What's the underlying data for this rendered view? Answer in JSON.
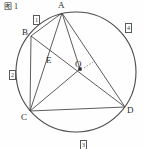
{
  "figure": {
    "caption": "图 1",
    "vertices": [
      {
        "name": "A",
        "label": "A",
        "x": 62,
        "y": 13,
        "lx": 58,
        "ly": 1
      },
      {
        "name": "B",
        "label": "B",
        "x": 31,
        "y": 36,
        "lx": 22,
        "ly": 28
      },
      {
        "name": "C",
        "label": "C",
        "x": 30,
        "y": 111,
        "lx": 21,
        "ly": 113
      },
      {
        "name": "D",
        "label": "D",
        "x": 125,
        "y": 107,
        "lx": 127,
        "ly": 106
      },
      {
        "name": "E",
        "label": "E",
        "x": 53,
        "y": 62,
        "lx": 46,
        "ly": 56
      },
      {
        "name": "O",
        "label": "O",
        "x": 80,
        "y": 69,
        "lx": 75,
        "ly": 60
      }
    ],
    "arc_labels": [
      {
        "name": "arc-label-1",
        "label": "1",
        "x": 33,
        "y": 9
      },
      {
        "name": "arc-label-2",
        "label": "2",
        "x": 9,
        "y": 64
      },
      {
        "name": "arc-label-3",
        "label": "3",
        "x": 80,
        "y": 134
      },
      {
        "name": "arc-label-4",
        "label": "4",
        "x": 125,
        "y": 17
      }
    ],
    "circle": {
      "cx": 76,
      "cy": 72,
      "r": 60
    },
    "segments": [
      {
        "name": "segment-AB",
        "from": "A",
        "to": "B"
      },
      {
        "name": "segment-AC",
        "from": "A",
        "to": "C"
      },
      {
        "name": "segment-AD",
        "from": "A",
        "to": "D"
      },
      {
        "name": "segment-AO",
        "from": "A",
        "to": "O"
      },
      {
        "name": "segment-BC",
        "from": "B",
        "to": "C"
      },
      {
        "name": "segment-BD",
        "from": "B",
        "to": "D"
      },
      {
        "name": "segment-CD",
        "from": "C",
        "to": "D"
      },
      {
        "name": "segment-CO",
        "from": "C",
        "to": "O"
      }
    ],
    "colors": {
      "stroke": "#4a4a4a",
      "text": "#2b2b2b",
      "background": "#fefefe"
    }
  }
}
